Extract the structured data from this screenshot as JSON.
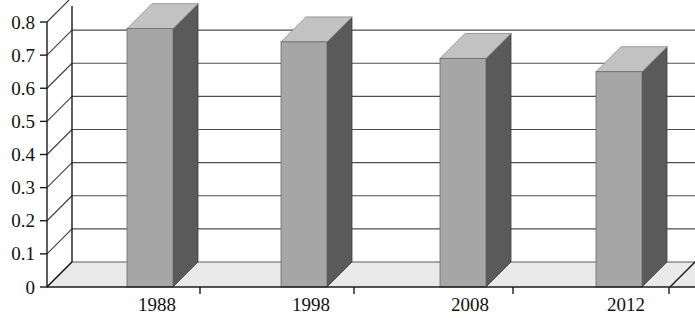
{
  "chart_data": {
    "type": "bar",
    "title": "",
    "subtitle": "",
    "xlabel": "",
    "ylabel": "",
    "categories": [
      "1988",
      "1998",
      "2008",
      "2012"
    ],
    "values": [
      0.78,
      0.74,
      0.69,
      0.65
    ],
    "series": [
      {
        "name": "Series 1",
        "values": [
          0.78,
          0.74,
          0.69,
          0.65
        ]
      }
    ],
    "ylim": [
      0,
      0.8
    ],
    "ytick_labels": [
      "0",
      "0.1",
      "0.2",
      "0.3",
      "0.4",
      "0.5",
      "0.6",
      "0.7",
      "0.8"
    ],
    "ytick_values": [
      0,
      0.1,
      0.2,
      0.3,
      0.4,
      0.5,
      0.6,
      0.7,
      0.8
    ],
    "grid": true,
    "legend": false,
    "legend_position": "none",
    "style": "3d-column",
    "colors": {
      "bar_front": "#a6a6a6",
      "bar_side": "#5a5a5a",
      "bar_top": "#c2c2c2",
      "floor": "#e8e8e8",
      "gridline": "#4d4d4d",
      "axis": "#1a1a1a",
      "background": "#ffffff",
      "text": "#111111"
    },
    "annotations": []
  },
  "axis": {
    "y_ticks": [
      {
        "label": "0.8",
        "value": 0.8
      },
      {
        "label": "0.7",
        "value": 0.7
      },
      {
        "label": "0.6",
        "value": 0.6
      },
      {
        "label": "0.5",
        "value": 0.5
      },
      {
        "label": "0.4",
        "value": 0.4
      },
      {
        "label": "0.3",
        "value": 0.3
      },
      {
        "label": "0.2",
        "value": 0.2
      },
      {
        "label": "0.1",
        "value": 0.1
      },
      {
        "label": "0",
        "value": 0
      }
    ],
    "x_ticks": [
      {
        "label": "1988"
      },
      {
        "label": "1998"
      },
      {
        "label": "2008"
      },
      {
        "label": "2012"
      }
    ]
  }
}
